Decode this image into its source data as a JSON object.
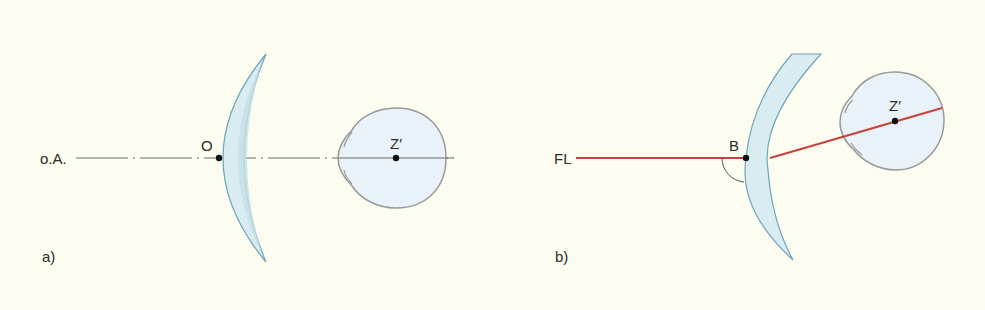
{
  "colors": {
    "background": "#FDFCF0",
    "lens_fill": "#D9ECF1",
    "lens_band": "#C3E0E6",
    "lens_stroke": "#6FA6B8",
    "eye_fill": "#E9F2F8",
    "eye_stroke": "#9A9A9A",
    "axis": "#6a6a6a",
    "ray": "#C8413A",
    "point": "#111111"
  },
  "panel_a": {
    "label": "a)",
    "axis_label": "o.A.",
    "lens_point_label": "O",
    "eye_center_label": "Z′"
  },
  "panel_b": {
    "label": "b)",
    "ray_label": "FL",
    "lens_point_label": "B",
    "eye_center_label": "Z′"
  }
}
